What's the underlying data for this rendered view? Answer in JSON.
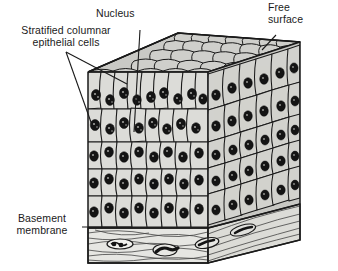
{
  "figure": {
    "view": "three-dimensional block diagram",
    "background_color": "#ffffff",
    "ink_color": "#1a1a1a",
    "cell_fill_color": "#d8d8d4",
    "top_face_fill_color": "#c9c9c5",
    "side_face_fill_color": "#c2c2be",
    "membrane_fill_color": "#e4e4e0",
    "nucleus_color": "#141414"
  },
  "labels": {
    "stratified": "Stratified columnar\nepithelial cells",
    "nucleus": "Nucleus",
    "free_surface": "Free\nsurface",
    "basement": "Basement\nmembrane"
  },
  "diagram": {
    "layers": [
      "free surface (apical cobblestone face)",
      "stratified columnar epithelial cell layers",
      "basement membrane",
      "underlying fibrous connective tissue"
    ],
    "cell_layer_count": 5,
    "front_face_columns": 9,
    "right_face_columns": 6
  }
}
